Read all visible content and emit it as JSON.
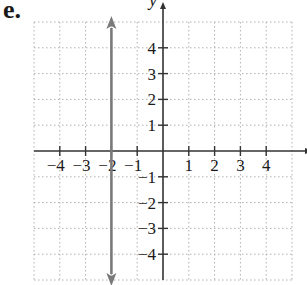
{
  "problem_label": "e.",
  "chart_data": {
    "type": "line",
    "title": "",
    "xlabel": "x",
    "ylabel": "y",
    "xlim": [
      -5,
      5
    ],
    "ylim": [
      -5,
      5
    ],
    "grid": true,
    "x_ticks": [
      -4,
      -3,
      -2,
      -1,
      1,
      2,
      3,
      4
    ],
    "y_ticks": [
      -4,
      -3,
      -2,
      -1,
      1,
      2,
      3,
      4
    ],
    "series": [
      {
        "name": "x = -2",
        "kind": "vertical-line",
        "x": -2,
        "y_range": [
          -5,
          5
        ],
        "arrows": "both",
        "color": "#7a7a7a"
      }
    ]
  },
  "colors": {
    "axis": "#333333",
    "grid": "#b0b0b0",
    "line": "#7a7a7a",
    "text": "#1a1a1a"
  }
}
